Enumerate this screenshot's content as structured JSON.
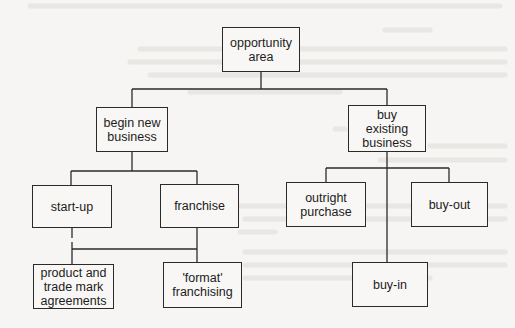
{
  "diagram": {
    "type": "tree",
    "root": "opportunity-area",
    "nodes": {
      "opportunity_area": {
        "label": "opportunity\narea"
      },
      "begin_new_business": {
        "label": "begin new\nbusiness"
      },
      "buy_existing_business": {
        "label": "buy\nexisting\nbusiness"
      },
      "start_up": {
        "label": "start-up"
      },
      "franchise": {
        "label": "franchise"
      },
      "product_trade_mark": {
        "label": "product and\ntrade mark\nagreements"
      },
      "format_franchising": {
        "label": "'format'\nfranchising"
      },
      "outright_purchase": {
        "label": "outright\npurchase"
      },
      "buy_out": {
        "label": "buy-out"
      },
      "buy_in": {
        "label": "buy-in"
      }
    },
    "edges": [
      [
        "opportunity area",
        "begin new business"
      ],
      [
        "opportunity area",
        "buy existing business"
      ],
      [
        "begin new business",
        "start-up"
      ],
      [
        "begin new business",
        "franchise"
      ],
      [
        "start-up",
        "product and trade mark agreements"
      ],
      [
        "start-up",
        "'format' franchising"
      ],
      [
        "franchise",
        "product and trade mark agreements"
      ],
      [
        "franchise",
        "'format' franchising"
      ],
      [
        "buy existing business",
        "outright purchase"
      ],
      [
        "buy existing business",
        "buy-out"
      ],
      [
        "buy existing business",
        "buy-in"
      ]
    ],
    "colors": {
      "line": "#2a2a2a",
      "background": "#f6f5f3",
      "bleed_text": "#d9d7d3"
    }
  }
}
